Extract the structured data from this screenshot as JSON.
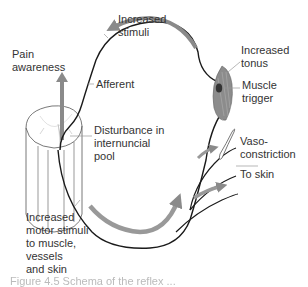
{
  "diagram": {
    "type": "reflex-loop schematic",
    "labels": {
      "increased_stimuli": [
        "Increased",
        "stimuli"
      ],
      "pain_awareness": [
        "Pain",
        "awareness"
      ],
      "afferent": "Afferent",
      "increased_tonus": [
        "Increased",
        "tonus"
      ],
      "muscle_trigger": [
        "Muscle",
        "trigger"
      ],
      "disturbance": [
        "Disturbance in",
        "internuncial",
        "pool"
      ],
      "vasoconstriction": [
        "Vaso-",
        "constriction"
      ],
      "to_skin": "To skin",
      "increased_motor": [
        "Increased",
        "motor stimuli",
        "to muscle,",
        "vessels",
        "and skin"
      ]
    },
    "caption": "Figure 4.5  Schema of the reflex ...",
    "colors": {
      "nerve_line": "#1a1a1a",
      "arrow": "#8a8a8a",
      "muscle": "#7a7a7a",
      "cord_outline": "#555555"
    }
  }
}
